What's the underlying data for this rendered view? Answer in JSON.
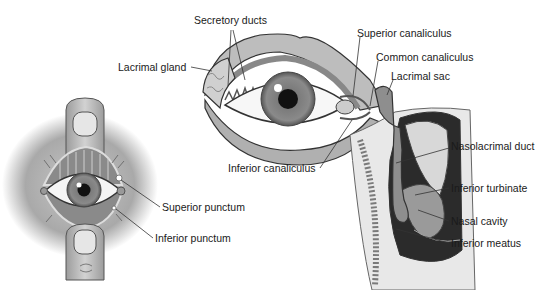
{
  "figure": {
    "panels": [
      {
        "id": "eyelid-eversion",
        "description": "Eye with lids held open by fingers showing puncta"
      },
      {
        "id": "lacrimal-system",
        "description": "Eye with lacrimal gland and drainage to nasal cavity"
      }
    ]
  },
  "labels": {
    "secretory_ducts": "Secretory ducts",
    "lacrimal_gland": "Lacrimal gland",
    "superior_canaliculus": "Superior canaliculus",
    "common_canaliculus": "Common canaliculus",
    "lacrimal_sac": "Lacrimal sac",
    "nasolacrimal_duct": "Nasolacrimal duct",
    "inferior_canaliculus": "Inferior canaliculus",
    "inferior_turbinate": "Inferior turbinate",
    "nasal_cavity": "Nasal cavity",
    "inferior_meatus": "Inferior meatus",
    "superior_punctum": "Superior punctum",
    "inferior_punctum": "Inferior punctum"
  },
  "colors": {
    "line": "#333333",
    "tissue_light": "#d9d9d9",
    "tissue_mid": "#9a9a9a",
    "tissue_dark": "#2b2b2b",
    "skin": "#bdbdbd"
  }
}
